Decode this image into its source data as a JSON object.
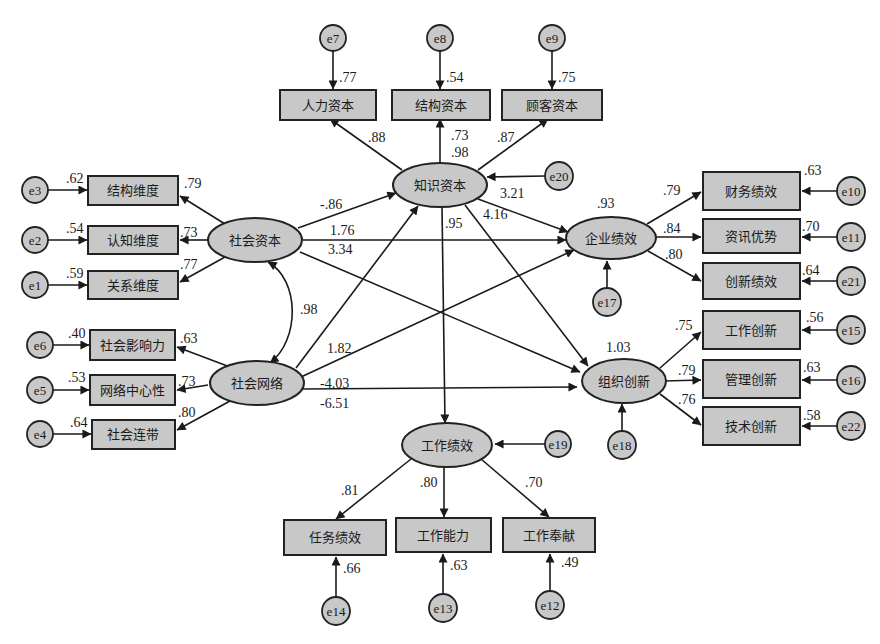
{
  "diagram": {
    "type": "structural-equation-model",
    "colors": {
      "node_fill": "#c8c8c8",
      "stroke": "#222222",
      "background": "#ffffff"
    },
    "latent": {
      "knowledge_capital": {
        "label": "知识资本",
        "r2": ".98"
      },
      "social_capital": {
        "label": "社会资本"
      },
      "social_network": {
        "label": "社会网络"
      },
      "firm_performance": {
        "label": "企业绩效",
        "r2": ".93"
      },
      "org_innovation": {
        "label": "组织创新",
        "r2": "1.03"
      },
      "work_performance": {
        "label": "工作绩效",
        "r2": ".9?"
      }
    },
    "observed": {
      "human_capital": {
        "label": "人力资本",
        "loading": ".88",
        "r2": ".77",
        "error": "e7"
      },
      "structural_capital": {
        "label": "结构资本",
        "loading": ".98",
        "r2": ".54",
        "error": "e8"
      },
      "customer_capital": {
        "label": "顾客资本",
        "loading": ".87",
        "r2": ".75",
        "error": "e9"
      },
      "structural_dim": {
        "label": "结构维度",
        "loading": ".79",
        "r2": ".62",
        "error": "e3"
      },
      "cognitive_dim": {
        "label": "认知维度",
        "loading": ".73",
        "r2": ".54",
        "error": "e2"
      },
      "relational_dim": {
        "label": "关系维度",
        "loading": ".77",
        "r2": ".59",
        "error": "e1"
      },
      "social_influence": {
        "label": "社会影响力",
        "loading": ".63",
        "r2": ".40",
        "error": "e6"
      },
      "network_centrality": {
        "label": "网络中心性",
        "loading": ".73",
        "r2": ".53",
        "error": "e5"
      },
      "social_ties": {
        "label": "社会连带",
        "loading": ".80",
        "r2": ".64",
        "error": "e4"
      },
      "financial_perf": {
        "label": "财务绩效",
        "loading": ".79",
        "r2": ".63",
        "error": "e10"
      },
      "info_advantage": {
        "label": "资讯优势",
        "loading": ".84",
        "r2": ".70",
        "error": "e11"
      },
      "innovation_perf": {
        "label": "创新绩效",
        "loading": ".80",
        "r2": ".64",
        "error": "e21"
      },
      "work_innovation": {
        "label": "工作创新",
        "loading": ".75",
        "r2": ".56",
        "error": "e15"
      },
      "mgmt_innovation": {
        "label": "管理创新",
        "loading": ".79",
        "r2": ".63",
        "error": "e16"
      },
      "tech_innovation": {
        "label": "技术创新",
        "loading": ".76",
        "r2": ".58",
        "error": "e22"
      },
      "task_perf": {
        "label": "任务绩效",
        "loading": ".81",
        "r2": ".66",
        "error": "e14"
      },
      "work_ability": {
        "label": "工作能力",
        "loading": ".80",
        "r2": ".63",
        "error": "e13"
      },
      "work_dedication": {
        "label": "工作奉献",
        "loading": ".70",
        "r2": ".49",
        "error": "e12"
      }
    },
    "structural_paths": {
      "sc_to_kc": "-.86",
      "sc_to_fp": "1.76",
      "sc_to_oi": "3.34",
      "kc_to_fp": "3.21",
      "kc_to_oi": "4.16",
      "kc_to_wp": ".95",
      "sn_to_kc": "1.82",
      "sn_to_fp": "-4.03",
      "sn_to_oi": "-6.51",
      "sc_sn_covariance": ".98",
      "kc_r2_upper": ".73"
    },
    "errors": {
      "e20": "e20",
      "e17": "e17",
      "e18": "e18",
      "e19": "e19"
    }
  }
}
